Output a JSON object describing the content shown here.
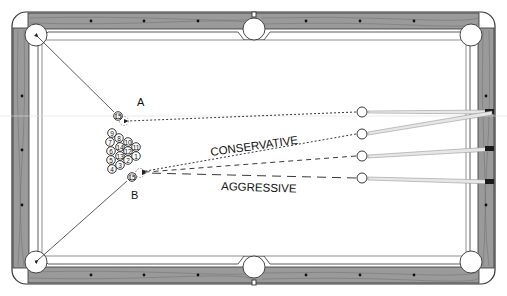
{
  "diagram": {
    "type": "billiards-shot-diagram",
    "colors": {
      "rail_wood": "#9a9a9a",
      "rail_grain": "#6e6e6e",
      "rail_outline": "#333333",
      "felt": "#ffffff",
      "line": "#222222",
      "cue_stick": "#bbbbbb",
      "cue_tip": "#1a1a1a"
    },
    "labels": {
      "point_a": "A",
      "point_b": "B",
      "conservative": "CONSERVATIVE",
      "aggressive": "AGGRESSIVE"
    },
    "target_balls": {
      "a": {
        "number": "15",
        "x": 118,
        "y": 116
      },
      "b": {
        "number": "15",
        "x": 132,
        "y": 177
      }
    },
    "rack": [
      {
        "number": "9",
        "x": 112,
        "y": 133
      },
      {
        "number": "7",
        "x": 110,
        "y": 142
      },
      {
        "number": "8",
        "x": 119,
        "y": 138
      },
      {
        "number": "10",
        "x": 128,
        "y": 142
      },
      {
        "number": "6",
        "x": 111,
        "y": 151
      },
      {
        "number": "14",
        "x": 120,
        "y": 147
      },
      {
        "number": "12",
        "x": 128,
        "y": 151
      },
      {
        "number": "11",
        "x": 136,
        "y": 147
      },
      {
        "number": "5",
        "x": 111,
        "y": 160
      },
      {
        "number": "13",
        "x": 120,
        "y": 156
      },
      {
        "number": "2",
        "x": 128,
        "y": 160
      },
      {
        "number": "1",
        "x": 136,
        "y": 156
      },
      {
        "number": "4",
        "x": 112,
        "y": 169
      },
      {
        "number": "3",
        "x": 120,
        "y": 165
      }
    ],
    "cue_balls": [
      {
        "x": 362,
        "y": 112
      },
      {
        "x": 362,
        "y": 133
      },
      {
        "x": 362,
        "y": 156
      },
      {
        "x": 362,
        "y": 178
      }
    ],
    "shot_lines": [
      {
        "name": "shot-to-a",
        "style": "dotted",
        "from": [
          356,
          112
        ],
        "to": [
          126,
          121
        ]
      },
      {
        "name": "conservative-shot",
        "style": "dotted",
        "from": [
          356,
          135
        ],
        "to": [
          145,
          172
        ]
      },
      {
        "name": "medium-shot",
        "style": "dashed",
        "from": [
          356,
          157
        ],
        "to": [
          145,
          173
        ]
      },
      {
        "name": "aggressive-shot",
        "style": "long-dashed",
        "from": [
          356,
          178
        ],
        "to": [
          145,
          174
        ]
      }
    ],
    "pocket_lines": [
      {
        "name": "line-a-to-top-left-pocket",
        "from": [
          114,
          112
        ],
        "to": [
          36,
          36
        ]
      },
      {
        "name": "line-b-to-bottom-left-pocket",
        "from": [
          127,
          181
        ],
        "to": [
          36,
          263
        ]
      }
    ],
    "diamonds": {
      "top": [
        91,
        144,
        198,
        306,
        360,
        414
      ],
      "bottom": [
        91,
        144,
        198,
        306,
        360,
        414
      ],
      "left": [
        96,
        150,
        205
      ],
      "right": [
        96,
        150,
        205
      ]
    },
    "ghost_line_y": 116
  }
}
